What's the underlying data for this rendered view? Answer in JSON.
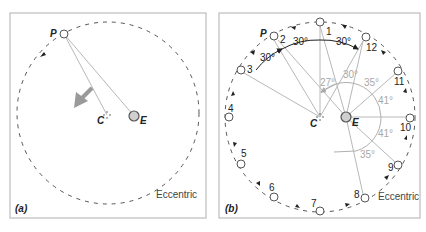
{
  "figure": {
    "panels": [
      {
        "id": "a",
        "label": "(a)",
        "orbit_label": "Eccentric",
        "points": {
          "planet": "P",
          "center": "C",
          "earth": "E"
        }
      },
      {
        "id": "b",
        "label": "(b)",
        "orbit_label": "Eccentric",
        "points": {
          "planet": "P",
          "center": "C",
          "earth": "E"
        },
        "positions": [
          "1",
          "2",
          "3",
          "4",
          "5",
          "6",
          "7",
          "8",
          "9",
          "10",
          "11",
          "12"
        ],
        "equal_angles_at_C": [
          "30°",
          "30°",
          "30°"
        ],
        "angles_at_E": [
          "27°",
          "30°",
          "35°",
          "41°",
          "41°",
          "35°"
        ]
      }
    ],
    "colors": {
      "frame": "#bdbdbd",
      "orbit": "#555555",
      "rays": "#b8b8b8",
      "earth_fill": "#cfcfcf",
      "motion_arrow": "#9a9a9a",
      "angle_gray": "#a8a8a8"
    }
  }
}
